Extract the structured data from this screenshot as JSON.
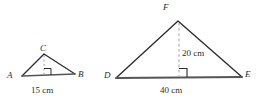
{
  "figure": {
    "background_color": "#ffffff",
    "stroke_color": "#2b2b2b",
    "base_stroke_color": "#5a5a5a",
    "dash_color": "#9a9a9a",
    "triangles": [
      {
        "id": "ABC",
        "vertices": {
          "A": {
            "label": "A",
            "x": 22,
            "y": 76
          },
          "B": {
            "label": "B",
            "x": 75,
            "y": 74
          },
          "C": {
            "label": "C",
            "x": 44,
            "y": 54
          }
        },
        "altitude": {
          "from": "C",
          "foot_x": 44,
          "foot_y": 75,
          "style": "dashed",
          "right_angle_marker": true,
          "length_label": ""
        },
        "base": {
          "from": "A",
          "to": "B",
          "length_label": "15 cm"
        }
      },
      {
        "id": "DEF",
        "vertices": {
          "D": {
            "label": "D",
            "x": 116,
            "y": 78
          },
          "E": {
            "label": "E",
            "x": 242,
            "y": 77
          },
          "F": {
            "label": "F",
            "x": 178,
            "y": 21
          }
        },
        "altitude": {
          "from": "F",
          "foot_x": 179,
          "foot_y": 77,
          "style": "dashed",
          "right_angle_marker": true,
          "length_label": "20 cm"
        },
        "base": {
          "from": "D",
          "to": "E",
          "length_label": "40 cm"
        }
      }
    ],
    "labels": {
      "A": "A",
      "B": "B",
      "C": "C",
      "D": "D",
      "E": "E",
      "F": "F",
      "base_small": "15 cm",
      "height_large": "20 cm",
      "base_large": "40 cm"
    }
  }
}
